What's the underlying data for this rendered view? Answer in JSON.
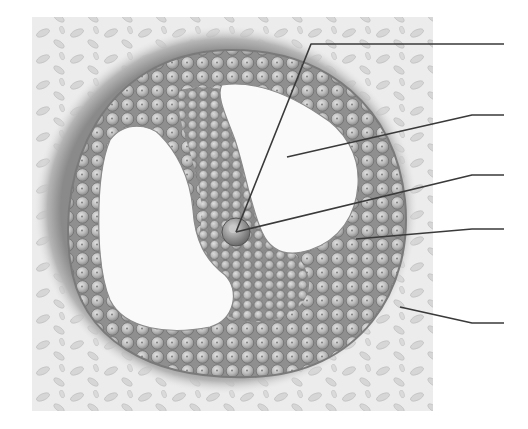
{
  "diagram": {
    "colors": {
      "background": "#ffffff",
      "stroma": "#e9e9e9",
      "stroma_cell": "#c8c8c8",
      "theca_ring": "#9a9a9a",
      "granulosa_fill": "#a9a9a9",
      "granulosa_cell": "#bdbdbd",
      "granulosa_cell_edge": "#6e6e6e",
      "antrum": "#fbfbfb",
      "oocyte": "#9c9c9c",
      "leader_line": "#3a3a3a"
    },
    "leader_lines": [
      {
        "id": "line-1",
        "points": [
          [
            236,
            232
          ],
          [
            311,
            44
          ],
          [
            504,
            44
          ]
        ],
        "label": ""
      },
      {
        "id": "line-2",
        "points": [
          [
            287,
            157
          ],
          [
            472,
            115
          ],
          [
            504,
            115
          ]
        ],
        "label": ""
      },
      {
        "id": "line-3",
        "points": [
          [
            236,
            232
          ],
          [
            472,
            175
          ],
          [
            504,
            175
          ]
        ],
        "label": ""
      },
      {
        "id": "line-4",
        "points": [
          [
            356,
            239
          ],
          [
            472,
            229
          ],
          [
            504,
            229
          ]
        ],
        "label": ""
      },
      {
        "id": "line-5",
        "points": [
          [
            400,
            307
          ],
          [
            472,
            323
          ],
          [
            504,
            323
          ]
        ],
        "label": ""
      }
    ]
  }
}
